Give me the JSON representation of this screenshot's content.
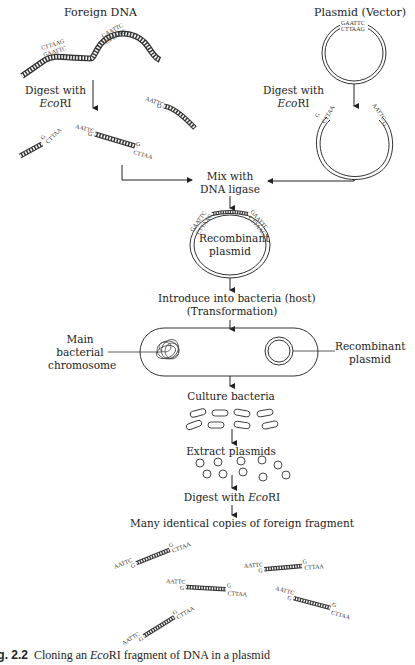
{
  "title": "Cloning an EcoRI fragment of DNA in a plasmid",
  "left_column": {
    "heading": "Foreign DNA",
    "step_label_line1": "Digest with",
    "step_label_line2_italic": "Eco",
    "step_label_line2_rest": "RI"
  },
  "right_column": {
    "heading": "Plasmid (Vector)",
    "step_label_line1": "Digest with",
    "step_label_line2_italic": "Eco",
    "step_label_line2_rest": "RI"
  },
  "steps": {
    "mix_line1": "Mix with",
    "mix_line2": "DNA ligase",
    "recombinant_line1": "Recombinant",
    "recombinant_line2": "plasmid",
    "introduce_line1": "Introduce into bacteria (host)",
    "introduce_line2": "(Transformation)",
    "chromosome_line1": "Main",
    "chromosome_line2": "bacterial",
    "chromosome_line3": "chromosome",
    "recomb_label_line1": "Recombinant",
    "recomb_label_line2": "plasmid",
    "culture": "Culture bacteria",
    "extract": "Extract plasmids",
    "digest_prefix": "Digest with ",
    "digest_italic": "Eco",
    "digest_rest": "RI",
    "copies": "Many identical copies of foreign fragment"
  },
  "sequences": {
    "top_strand_site": "GAATTC",
    "bottom_strand_site": "CTTAAG",
    "sticky_end_5": "AATTC",
    "sticky_end_3": "CTTAA",
    "single_g": "G"
  },
  "caption": {
    "fig_label": "ig. 2.2",
    "text_before": "Cloning an ",
    "text_italic": "Eco",
    "text_after": "RI fragment of DNA in a plasmid"
  }
}
